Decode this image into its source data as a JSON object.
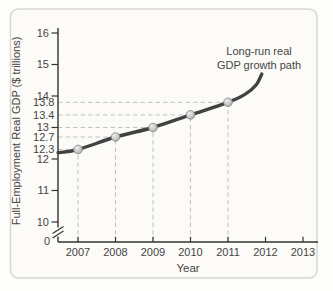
{
  "chart_data": {
    "type": "line",
    "title": "",
    "annotation": [
      "Long-run real",
      "GDP growth path"
    ],
    "xlabel": "Year",
    "ylabel": "Full-Employment Real GDP ($ trillions)",
    "x": [
      2007,
      2008,
      2009,
      2010,
      2011
    ],
    "values": [
      12.3,
      12.7,
      13.0,
      13.4,
      13.8
    ],
    "x_tick_labels": [
      "2007",
      "2008",
      "2009",
      "2010",
      "2011",
      "2012",
      "2013"
    ],
    "y_major_tick_labels": [
      "16",
      "15",
      "14",
      "13",
      "12",
      "11",
      "10"
    ],
    "y_guide_labels": [
      "13.8",
      "13.4",
      "12.7",
      "12.3"
    ],
    "origin_label": "0",
    "curve_start": {
      "year": 2006.47,
      "value": 12.2
    },
    "curve_extension": [
      {
        "year": 2011.45,
        "value": 14.05
      },
      {
        "year": 2011.75,
        "value": 14.35
      },
      {
        "year": 2011.9,
        "value": 14.7
      }
    ],
    "ylim_displayed": [
      10,
      16
    ],
    "axis_break_on_y": true,
    "grid": "dashed guide lines from each data point to both axes",
    "legend": "none",
    "colors": {
      "curve": "#414141",
      "axis": "#333333",
      "text": "#454545",
      "guide": "#c2c2c2",
      "marker_highlight": "#ececec",
      "marker_fill": "#c9c9c9",
      "marker_shade": "#a0a0a0",
      "marker_stroke": "#8a8a8a",
      "panel_bg": "#fcfbf7",
      "panel_border": "#d7d6d0"
    }
  }
}
